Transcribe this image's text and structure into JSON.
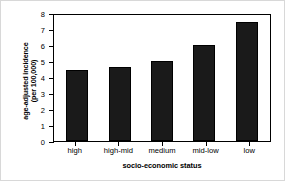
{
  "chart_data": {
    "type": "bar",
    "title": "",
    "categories": [
      "high",
      "high-mid",
      "medium",
      "mid-low",
      "low"
    ],
    "values": [
      4.45,
      4.6,
      5.0,
      6.0,
      7.45
    ],
    "series": [
      {
        "name": "age-adjusted incidence",
        "values": [
          4.45,
          4.6,
          5.0,
          6.0,
          7.45
        ]
      }
    ],
    "xlabel": "socio-economic status",
    "ylabel_line1": "age-adjusted incidence",
    "ylabel_line2": "(per 100,000)",
    "ylabel": "age-adjusted incidence (per 100,000)",
    "ylim": [
      0,
      8
    ],
    "yticks": [
      "8",
      "7",
      "6",
      "5",
      "4",
      "3",
      "2",
      "1",
      "0"
    ],
    "ytick_values": [
      8,
      7,
      6,
      5,
      4,
      3,
      2,
      1,
      0
    ],
    "grid": false,
    "legend": false,
    "legend_position": "none",
    "bar_color": "#1a1a1a",
    "bar_edge_color": "#000000",
    "axis_color": "#000000",
    "background_color": "#ffffff"
  }
}
